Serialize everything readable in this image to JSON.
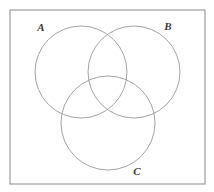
{
  "figure": {
    "kind": "venn-diagram",
    "background_color": "#ffffff",
    "stroke_color": "#9a9a9a",
    "frame_color": "#8a8a8a",
    "label_color": "#3a3a3a",
    "stroke_width": 0.9,
    "frame": {
      "x": 10,
      "y": 10,
      "width": 195,
      "height": 174,
      "fill": "#ffffff"
    },
    "sets": [
      {
        "id": "A",
        "label": "A",
        "cx": 81,
        "cy": 72,
        "r": 46,
        "label_x": 41,
        "label_y": 31
      },
      {
        "id": "B",
        "label": "B",
        "cx": 134,
        "cy": 72,
        "r": 46,
        "label_x": 168,
        "label_y": 30
      },
      {
        "id": "C",
        "label": "C",
        "cx": 108,
        "cy": 123,
        "r": 47,
        "label_x": 137,
        "label_y": 175
      }
    ]
  }
}
